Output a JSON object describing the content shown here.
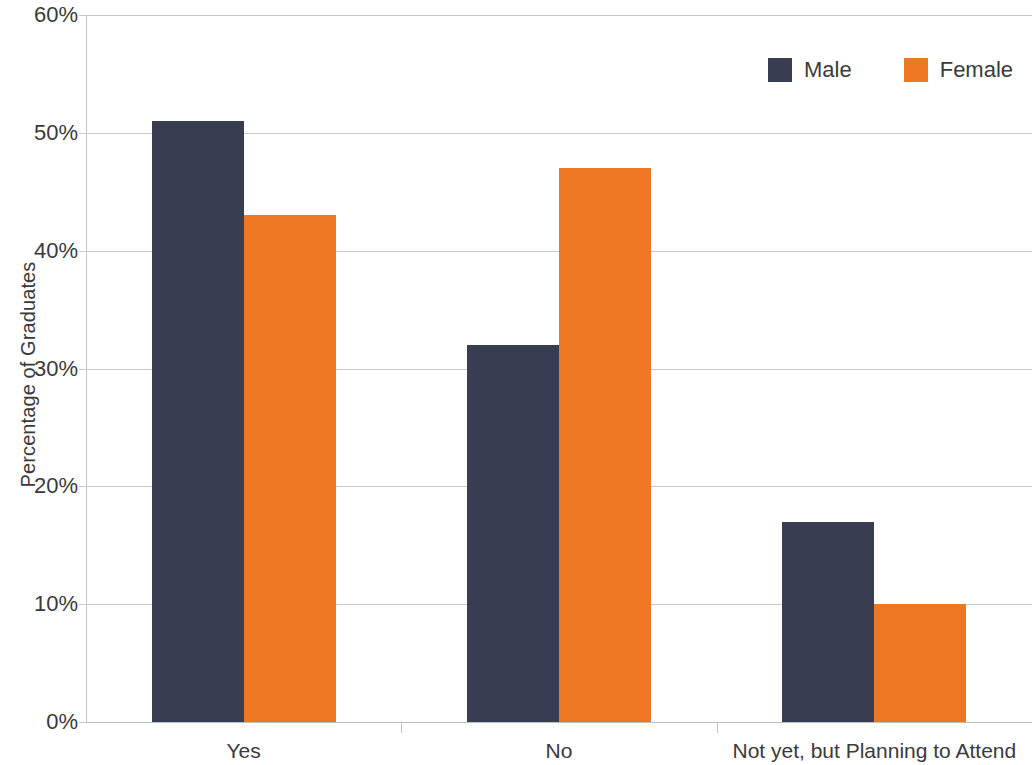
{
  "chart_data": {
    "type": "bar",
    "title": "",
    "subtitle": "",
    "xlabel": "",
    "ylabel": "Percentage of Graduates",
    "categories": [
      "Yes",
      "No",
      "Not yet, but Planning to Attend"
    ],
    "series": [
      {
        "name": "Male",
        "color": "#383d52",
        "values": [
          51,
          32,
          17
        ]
      },
      {
        "name": "Female",
        "color": "#ed7723",
        "values": [
          43,
          47,
          10
        ]
      }
    ],
    "ylim": [
      0,
      60
    ],
    "y_tick_values": [
      0,
      10,
      20,
      30,
      40,
      50,
      60
    ],
    "y_tick_labels": [
      "0%",
      "10%",
      "20%",
      "30%",
      "40%",
      "50%",
      "60%"
    ],
    "value_suffix": "%",
    "grid": {
      "horizontal": true,
      "vertical": false
    },
    "legend": {
      "position": "top-right",
      "orientation": "horizontal"
    },
    "bar_group_gap": true,
    "data_labels": false
  },
  "axes": {
    "y_title": "Percentage of Graduates"
  },
  "legend": {
    "entries": [
      {
        "label": "Male",
        "swatch_color": "#383d52"
      },
      {
        "label": "Female",
        "swatch_color": "#ed7723"
      }
    ]
  },
  "colors": {
    "male": "#383d52",
    "female": "#ed7723",
    "gridline": "#c9c9c9",
    "axis": "#c4c4c4",
    "text": "#3a3a3a",
    "background": "#ffffff"
  }
}
